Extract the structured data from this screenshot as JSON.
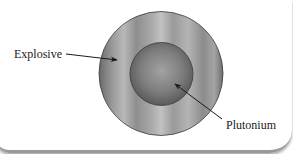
{
  "diagram": {
    "labels": {
      "explosive": "Explosive",
      "plutonium": "Plutonium"
    },
    "colors": {
      "background": "#ffffff",
      "outline": "#3a3a3a",
      "arrow": "#1a1a1a",
      "outer_dark": "#6a6a6a",
      "outer_light": "#b8b8b8",
      "inner_center": "#a0a0a0",
      "inner_edge": "#5a5a5a"
    }
  }
}
